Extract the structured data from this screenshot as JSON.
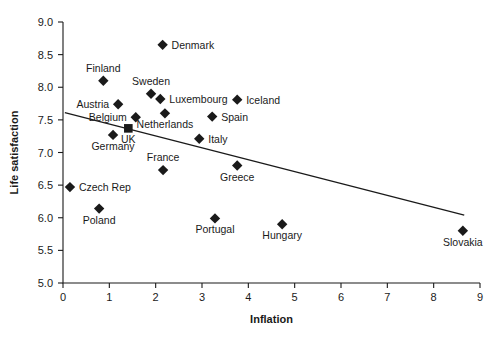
{
  "chart_data": {
    "type": "scatter",
    "title": "",
    "xlabel": "Inflation",
    "ylabel": "Life satisfaction",
    "xlim": [
      0,
      9
    ],
    "ylim": [
      5.0,
      9.0
    ],
    "xticks": [
      "0",
      "1",
      "2",
      "3",
      "4",
      "5",
      "6",
      "7",
      "8",
      "9"
    ],
    "yticks": [
      "5.0",
      "5.5",
      "6.0",
      "6.5",
      "7.0",
      "7.5",
      "8.0",
      "8.5",
      "9.0"
    ],
    "grid": false,
    "legend": "none",
    "marker_shape": "diamond",
    "marker_color": "#1a1a1a",
    "points": [
      {
        "name": "Denmark",
        "x": 2.15,
        "y": 8.65,
        "label_pos": "right"
      },
      {
        "name": "Finland",
        "x": 0.87,
        "y": 8.1,
        "label_pos": "above"
      },
      {
        "name": "Sweden",
        "x": 1.9,
        "y": 7.9,
        "label_pos": "above"
      },
      {
        "name": "Austria",
        "x": 1.19,
        "y": 7.74,
        "label_pos": "left"
      },
      {
        "name": "Luxembourg",
        "x": 2.1,
        "y": 7.82,
        "label_pos": "right"
      },
      {
        "name": "Iceland",
        "x": 3.76,
        "y": 7.81,
        "label_pos": "right"
      },
      {
        "name": "Belgium",
        "x": 1.57,
        "y": 7.54,
        "label_pos": "left"
      },
      {
        "name": "Spain",
        "x": 3.22,
        "y": 7.55,
        "label_pos": "right"
      },
      {
        "name": "Netherlands",
        "x": 2.2,
        "y": 7.6,
        "label_pos": "below"
      },
      {
        "name": "UK",
        "x": 1.41,
        "y": 7.37,
        "label_pos": "below",
        "shape": "square"
      },
      {
        "name": "Germany",
        "x": 1.08,
        "y": 7.27,
        "label_pos": "below"
      },
      {
        "name": "Italy",
        "x": 2.94,
        "y": 7.21,
        "label_pos": "right"
      },
      {
        "name": "France",
        "x": 2.16,
        "y": 6.73,
        "label_pos": "above"
      },
      {
        "name": "Greece",
        "x": 3.76,
        "y": 6.8,
        "label_pos": "below"
      },
      {
        "name": "Czech Rep",
        "x": 0.15,
        "y": 6.47,
        "label_pos": "right"
      },
      {
        "name": "Poland",
        "x": 0.78,
        "y": 6.14,
        "label_pos": "below"
      },
      {
        "name": "Portugal",
        "x": 3.28,
        "y": 5.99,
        "label_pos": "below"
      },
      {
        "name": "Hungary",
        "x": 4.73,
        "y": 5.9,
        "label_pos": "below"
      },
      {
        "name": "Slovakia",
        "x": 8.63,
        "y": 5.8,
        "label_pos": "below"
      }
    ],
    "trendline": {
      "x_start": 0.04,
      "y_start": 7.61,
      "x_end": 8.66,
      "y_end": 6.04,
      "style": "solid",
      "color": "#1a1a1a"
    }
  }
}
